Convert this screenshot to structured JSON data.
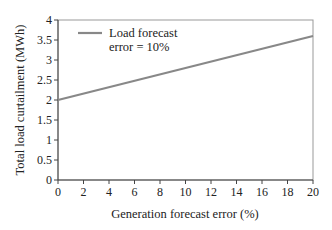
{
  "chart_data": {
    "type": "line",
    "title": "",
    "xlabel": "Generation forecast error (%)",
    "ylabel": "Total load curtailment (MWh)",
    "xlim": [
      0,
      20
    ],
    "ylim": [
      0,
      4
    ],
    "xticks": [
      0,
      2,
      4,
      6,
      8,
      10,
      12,
      14,
      16,
      18,
      20
    ],
    "yticks": [
      0,
      0.5,
      1,
      1.5,
      2,
      2.5,
      3,
      3.5,
      4
    ],
    "ytick_labels": [
      "0",
      "0.5",
      "1",
      "1.5",
      "2",
      "2.5",
      "3",
      "3.5",
      "4"
    ],
    "grid": false,
    "legend_position": "upper left",
    "series": [
      {
        "name": "Load forecast error = 10%",
        "legend_lines": [
          "Load forecast",
          "error = 10%"
        ],
        "color": "#888888",
        "x": [
          0,
          20
        ],
        "y": [
          2.0,
          3.6
        ]
      }
    ]
  }
}
